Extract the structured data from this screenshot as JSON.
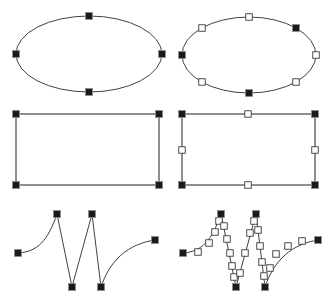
{
  "figure": {
    "background_color": "#ffffff",
    "width": 335,
    "height": 305,
    "colors": {
      "curve_stroke": "#2b2b2b",
      "rect_stroke": "#6a6a6a",
      "handle_filled_fill": "#1a1a1a",
      "handle_filled_stroke": "#8e8e8e",
      "handle_hollow_fill": "#ffffff",
      "handle_hollow_stroke": "#3a3a3a"
    },
    "handle_size": {
      "filled": 7,
      "hollow": 6.5
    },
    "layout": {
      "rows": 3,
      "columns": 2,
      "left_column_label": "node handles only",
      "right_column_label": "node handles plus subdivision handles"
    }
  },
  "shapes": [
    {
      "id": "ellipse-nodes-only",
      "name": "top-left-ellipse",
      "type": "ellipse",
      "row": 1,
      "column": "left",
      "geometry": {
        "cx": 89,
        "cy": 54,
        "rx": 73,
        "ry": 38
      },
      "stroke": "#2b2b2b",
      "handles_filled": [
        {
          "x": 89,
          "y": 16
        },
        {
          "x": 162,
          "y": 54
        },
        {
          "x": 89,
          "y": 92
        },
        {
          "x": 16,
          "y": 54
        }
      ],
      "handles_hollow": []
    },
    {
      "id": "ellipse-with-subdivisions",
      "name": "top-right-ellipse",
      "type": "ellipse",
      "row": 1,
      "column": "right",
      "geometry": {
        "cx": 249,
        "cy": 55,
        "rx": 67,
        "ry": 38
      },
      "stroke": "#2b2b2b",
      "handles_filled": [
        {
          "x": 296,
          "y": 28
        },
        {
          "x": 249,
          "y": 93
        },
        {
          "x": 182,
          "y": 55
        }
      ],
      "handles_hollow": [
        {
          "x": 249,
          "y": 17
        },
        {
          "x": 202,
          "y": 28
        },
        {
          "x": 316,
          "y": 55
        },
        {
          "x": 202,
          "y": 82
        },
        {
          "x": 296,
          "y": 82
        }
      ]
    },
    {
      "id": "rectangle-nodes-only",
      "name": "middle-left-rectangle",
      "type": "rectangle",
      "row": 2,
      "column": "left",
      "geometry": {
        "x": 16,
        "y": 114,
        "width": 143,
        "height": 71
      },
      "stroke": "#6a6a6a",
      "handles_filled": [
        {
          "x": 16,
          "y": 114
        },
        {
          "x": 159,
          "y": 114
        },
        {
          "x": 159,
          "y": 185
        },
        {
          "x": 16,
          "y": 185
        }
      ],
      "handles_hollow": []
    },
    {
      "id": "rectangle-with-subdivisions",
      "name": "middle-right-rectangle",
      "type": "rectangle",
      "row": 2,
      "column": "right",
      "geometry": {
        "x": 182,
        "y": 114,
        "width": 133,
        "height": 71
      },
      "stroke": "#6a6a6a",
      "handles_filled": [
        {
          "x": 182,
          "y": 114
        },
        {
          "x": 315,
          "y": 114
        },
        {
          "x": 315,
          "y": 185
        },
        {
          "x": 182,
          "y": 185
        }
      ],
      "handles_hollow": [
        {
          "x": 248,
          "y": 114
        },
        {
          "x": 315,
          "y": 150
        },
        {
          "x": 248,
          "y": 185
        },
        {
          "x": 182,
          "y": 150
        }
      ]
    },
    {
      "id": "zigzag-nodes-only",
      "name": "bottom-left-zigzag-path",
      "type": "path",
      "row": 3,
      "column": "left",
      "stroke": "#2b2b2b",
      "path_d": "M 18,253 C 38,252 48,240 57,214 L 72,287 L 92,214 L 101,287 C 110,260 128,244 155,240",
      "handles_filled": [
        {
          "x": 18,
          "y": 253
        },
        {
          "x": 57,
          "y": 214
        },
        {
          "x": 72,
          "y": 287
        },
        {
          "x": 92,
          "y": 214
        },
        {
          "x": 101,
          "y": 287
        },
        {
          "x": 155,
          "y": 240
        }
      ],
      "handles_hollow": []
    },
    {
      "id": "zigzag-with-subdivisions",
      "name": "bottom-right-zigzag-path",
      "type": "path",
      "row": 3,
      "column": "right",
      "stroke": "#2b2b2b",
      "path_d": "M 183,253 C 202,252 212,240 221,214 L 236,287 L 256,214 L 265,287 C 274,260 292,244 318,240",
      "handles_filled": [
        {
          "x": 183,
          "y": 253
        },
        {
          "x": 221,
          "y": 214
        },
        {
          "x": 236,
          "y": 287
        },
        {
          "x": 256,
          "y": 214
        },
        {
          "x": 265,
          "y": 287
        },
        {
          "x": 318,
          "y": 240
        }
      ],
      "handles_hollow": [
        {
          "x": 198,
          "y": 252
        },
        {
          "x": 209,
          "y": 243
        },
        {
          "x": 215,
          "y": 232
        },
        {
          "x": 219,
          "y": 221
        },
        {
          "x": 224,
          "y": 226
        },
        {
          "x": 227,
          "y": 239
        },
        {
          "x": 230,
          "y": 253
        },
        {
          "x": 232,
          "y": 266
        },
        {
          "x": 234,
          "y": 277
        },
        {
          "x": 240,
          "y": 273
        },
        {
          "x": 245,
          "y": 253
        },
        {
          "x": 250,
          "y": 233
        },
        {
          "x": 254,
          "y": 221
        },
        {
          "x": 258,
          "y": 230
        },
        {
          "x": 260,
          "y": 246
        },
        {
          "x": 262,
          "y": 262
        },
        {
          "x": 264,
          "y": 276
        },
        {
          "x": 270,
          "y": 268
        },
        {
          "x": 276,
          "y": 254
        },
        {
          "x": 288,
          "y": 246
        },
        {
          "x": 302,
          "y": 241
        }
      ]
    }
  ]
}
